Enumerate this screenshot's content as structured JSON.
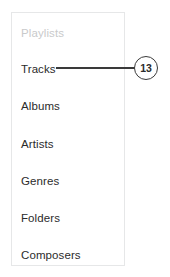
{
  "panel": {
    "name": "playlists-sidebar",
    "border_color": "#e6e7e8",
    "background_color": "#ffffff",
    "items": [
      {
        "label": "Playlists",
        "role": "section-header",
        "color": "#c9cacb"
      },
      {
        "label": "Tracks",
        "role": "nav-item",
        "color": "#2b2b2b"
      },
      {
        "label": "Albums",
        "role": "nav-item",
        "color": "#2b2b2b"
      },
      {
        "label": "Artists",
        "role": "nav-item",
        "color": "#2b2b2b"
      },
      {
        "label": "Genres",
        "role": "nav-item",
        "color": "#2b2b2b"
      },
      {
        "label": "Folders",
        "role": "nav-item",
        "color": "#2b2b2b"
      },
      {
        "label": "Composers",
        "role": "nav-item",
        "color": "#2b2b2b"
      }
    ]
  },
  "callout": {
    "number": "13",
    "points_to": "Tracks",
    "line_color": "#3a3a3a",
    "text_color": "#2b2b2b"
  }
}
